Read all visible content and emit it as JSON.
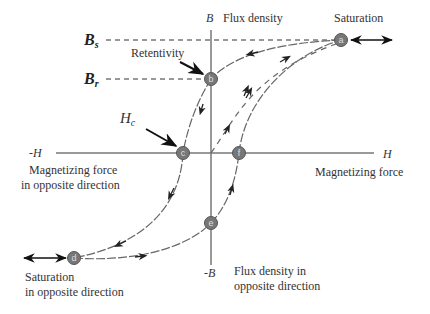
{
  "diagram": {
    "type": "hysteresis-loop",
    "axes": {
      "x_pos_label": "H",
      "x_neg_label": "-H",
      "y_pos_label": "B",
      "y_neg_label": "-B",
      "x_pos_desc": "Magnetizing force",
      "x_neg_desc_line1": "Magnetizing force",
      "x_neg_desc_line2": "in opposite direction",
      "y_pos_desc": "Flux density",
      "y_neg_desc_line1": "Flux density in",
      "y_neg_desc_line2": "opposite direction"
    },
    "annotations": {
      "saturation": "Saturation",
      "saturation_opp_line1": "Saturation",
      "saturation_opp_line2": "in opposite direction",
      "retentivity": "Retentivity",
      "bs_main": "B",
      "bs_sub": "s",
      "br_main": "B",
      "br_sub": "r",
      "hc_main": "H",
      "hc_sub": "c"
    },
    "points": [
      {
        "id": "a",
        "label": "a",
        "meaning": "Saturation"
      },
      {
        "id": "b",
        "label": "b",
        "meaning": "Retentivity (Br)"
      },
      {
        "id": "c",
        "label": "c",
        "meaning": "Coercivity (Hc)"
      },
      {
        "id": "d",
        "label": "d",
        "meaning": "Saturation in opposite direction"
      },
      {
        "id": "e",
        "label": "e",
        "meaning": "Residual flux in opposite direction"
      },
      {
        "id": "f",
        "label": "f",
        "meaning": "Coercive point positive side"
      }
    ],
    "colors": {
      "axis": "#777777",
      "curve": "#666666",
      "point_fill": "#777777",
      "text": "#333333"
    }
  }
}
